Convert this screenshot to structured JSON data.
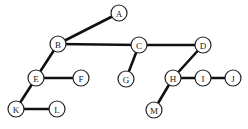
{
  "diagram": {
    "type": "tree",
    "background": "#ffffff",
    "edge_color": "#111111",
    "node_stroke": "#222222",
    "node_radius": 8,
    "nodes": [
      {
        "id": "A",
        "label": "A",
        "x": 119,
        "y": 13
      },
      {
        "id": "B",
        "label": "B",
        "x": 58,
        "y": 44
      },
      {
        "id": "C",
        "label": "C",
        "x": 139,
        "y": 45
      },
      {
        "id": "D",
        "label": "D",
        "x": 203,
        "y": 45
      },
      {
        "id": "E",
        "label": "E",
        "x": 36,
        "y": 78
      },
      {
        "id": "F",
        "label": "F",
        "x": 81,
        "y": 78
      },
      {
        "id": "G",
        "label": "G",
        "x": 126,
        "y": 79
      },
      {
        "id": "H",
        "label": "H",
        "x": 173,
        "y": 78
      },
      {
        "id": "I",
        "label": "I",
        "x": 203,
        "y": 78
      },
      {
        "id": "J",
        "label": "J",
        "x": 233,
        "y": 78
      },
      {
        "id": "K",
        "label": "K",
        "x": 16,
        "y": 109
      },
      {
        "id": "L",
        "label": "L",
        "x": 57,
        "y": 109
      },
      {
        "id": "M",
        "label": "M",
        "x": 154,
        "y": 110
      }
    ],
    "edges": [
      {
        "from": "A",
        "to": "B"
      },
      {
        "from": "B",
        "to": "C"
      },
      {
        "from": "C",
        "to": "D"
      },
      {
        "from": "B",
        "to": "E"
      },
      {
        "from": "E",
        "to": "F"
      },
      {
        "from": "C",
        "to": "G"
      },
      {
        "from": "D",
        "to": "H"
      },
      {
        "from": "H",
        "to": "I"
      },
      {
        "from": "I",
        "to": "J"
      },
      {
        "from": "E",
        "to": "K"
      },
      {
        "from": "K",
        "to": "L"
      },
      {
        "from": "H",
        "to": "M"
      }
    ]
  }
}
